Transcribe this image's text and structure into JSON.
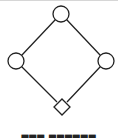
{
  "diagram": {
    "type": "hasse-diagram",
    "stroke_color": "#222222",
    "fill_color": "#ffffff",
    "nodes": [
      {
        "id": "top",
        "shape": "circle",
        "cx": 61,
        "cy": 14,
        "r": 8
      },
      {
        "id": "left",
        "shape": "circle",
        "cx": 16,
        "cy": 61,
        "r": 8
      },
      {
        "id": "right",
        "shape": "circle",
        "cx": 106,
        "cy": 61,
        "r": 8
      },
      {
        "id": "bottom",
        "shape": "diamond",
        "cx": 62,
        "cy": 107,
        "half": 8
      }
    ],
    "edges": [
      {
        "from": "top",
        "to": "left"
      },
      {
        "from": "top",
        "to": "right"
      },
      {
        "from": "left",
        "to": "bottom"
      },
      {
        "from": "right",
        "to": "bottom"
      }
    ]
  },
  "caption": {
    "text": "▀▀▀ ▀▀▀▀▀▀"
  }
}
